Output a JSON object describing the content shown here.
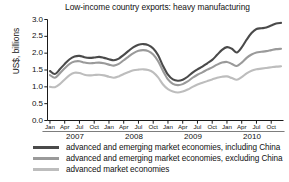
{
  "chart_data": {
    "type": "line",
    "title": "Low-income country exports: heavy manufacturing",
    "xlabel": "",
    "ylabel": "US$, billions",
    "ylim": [
      0.0,
      3.0
    ],
    "ytick_labels": [
      "0.0",
      "0.5",
      "1.0",
      "1.5",
      "2.0",
      "2.5",
      "3.0"
    ],
    "ytick_values": [
      0.0,
      0.5,
      1.0,
      1.5,
      2.0,
      2.5,
      3.0
    ],
    "grid": false,
    "legend_position": "below-axes",
    "x_months": [
      "Jan",
      "Apr",
      "Jul",
      "Oct"
    ],
    "x_years": [
      "2007",
      "2008",
      "2009",
      "2010"
    ],
    "x_tick_labels": [
      "Jan",
      "Apr",
      "Jul",
      "Oct",
      "Jan",
      "Apr",
      "Jul",
      "Oct",
      "Jan",
      "Apr",
      "Jul",
      "Oct",
      "Jan",
      "Apr",
      "Jul",
      "Oct"
    ],
    "colors": {
      "including_china": "#4a4a4a",
      "excluding_china": "#9a9a9a",
      "advanced": "#bdbdbd"
    },
    "series": [
      {
        "name": "advanced and emerging market economies, including China",
        "color": "#4a4a4a",
        "values": [
          1.47,
          1.38,
          1.52,
          1.68,
          1.82,
          1.9,
          1.92,
          1.88,
          1.86,
          1.87,
          1.89,
          1.86,
          1.82,
          1.79,
          1.84,
          1.95,
          2.07,
          2.18,
          2.25,
          2.27,
          2.24,
          2.14,
          1.94,
          1.62,
          1.36,
          1.22,
          1.18,
          1.21,
          1.3,
          1.42,
          1.52,
          1.6,
          1.7,
          1.8,
          1.95,
          2.1,
          2.18,
          2.13,
          2.02,
          2.17,
          2.4,
          2.6,
          2.72,
          2.74,
          2.76,
          2.82,
          2.88,
          2.9
        ]
      },
      {
        "name": "advanced and emerging market economies, excluding China",
        "color": "#9a9a9a",
        "values": [
          1.35,
          1.27,
          1.4,
          1.55,
          1.68,
          1.75,
          1.76,
          1.72,
          1.7,
          1.71,
          1.72,
          1.7,
          1.66,
          1.63,
          1.68,
          1.79,
          1.9,
          2.0,
          2.07,
          2.09,
          2.06,
          1.96,
          1.76,
          1.47,
          1.22,
          1.09,
          1.05,
          1.08,
          1.16,
          1.27,
          1.36,
          1.43,
          1.51,
          1.58,
          1.66,
          1.72,
          1.74,
          1.68,
          1.62,
          1.72,
          1.86,
          1.96,
          2.02,
          2.04,
          2.06,
          2.09,
          2.12,
          2.13
        ]
      },
      {
        "name": "advanced market economies",
        "color": "#bdbdbd",
        "values": [
          1.0,
          0.99,
          1.08,
          1.22,
          1.35,
          1.42,
          1.41,
          1.36,
          1.34,
          1.35,
          1.36,
          1.34,
          1.3,
          1.27,
          1.31,
          1.38,
          1.44,
          1.49,
          1.51,
          1.52,
          1.5,
          1.43,
          1.28,
          1.07,
          0.93,
          0.86,
          0.83,
          0.86,
          0.92,
          1.0,
          1.07,
          1.12,
          1.17,
          1.22,
          1.27,
          1.3,
          1.31,
          1.26,
          1.21,
          1.29,
          1.4,
          1.48,
          1.52,
          1.54,
          1.56,
          1.58,
          1.6,
          1.61
        ]
      }
    ]
  },
  "axes": {
    "ylabel": "US$, billions",
    "ytick_labels": [
      "3.0",
      "2.5",
      "2.0",
      "1.5",
      "1.0",
      "0.5",
      "0.0"
    ],
    "xtick_labels": [
      "Jan",
      "Apr",
      "Jul",
      "Oct",
      "Jan",
      "Apr",
      "Jul",
      "Oct",
      "Jan",
      "Apr",
      "Jul",
      "Oct",
      "Jan",
      "Apr",
      "Jul",
      "Oct"
    ],
    "year_labels": [
      "2007",
      "2008",
      "2009",
      "2010"
    ]
  },
  "legend": {
    "items": [
      {
        "label": "advanced and emerging market economies, including China",
        "color": "#4a4a4a"
      },
      {
        "label": "advanced and emerging market economies, excluding China",
        "color": "#9a9a9a"
      },
      {
        "label": "advanced market economies",
        "color": "#bdbdbd"
      }
    ]
  }
}
